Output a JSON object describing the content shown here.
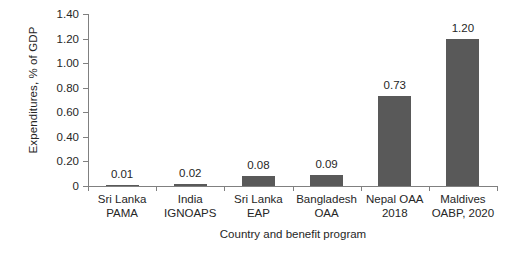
{
  "chart_data": {
    "type": "bar",
    "title": "",
    "subtitle": "",
    "xlabel": "Country and benefit program",
    "ylabel": "Expenditures, % of GDP",
    "categories": [
      "Sri Lanka PAMA",
      "India IGNOAPS",
      "Sri Lanka EAP",
      "Bangladesh OAA",
      "Nepal OAA 2018",
      "Maldives OABP, 2020"
    ],
    "category_lines": [
      [
        "Sri Lanka",
        "PAMA"
      ],
      [
        "India",
        "IGNOAPS"
      ],
      [
        "Sri Lanka",
        "EAP"
      ],
      [
        "Bangladesh",
        "OAA"
      ],
      [
        "Nepal OAA",
        "2018"
      ],
      [
        "Maldives",
        "OABP, 2020"
      ]
    ],
    "values": [
      0.01,
      0.02,
      0.08,
      0.09,
      0.73,
      1.2
    ],
    "data_labels": [
      "0.01",
      "0.02",
      "0.08",
      "0.09",
      "0.73",
      "1.20"
    ],
    "ylim": [
      0,
      1.4
    ],
    "ytick_values": [
      0,
      0.2,
      0.4,
      0.6,
      0.8,
      1.0,
      1.2,
      1.4
    ],
    "ytick_labels": [
      "0",
      "0.20",
      "0.40",
      "0.60",
      "0.80",
      "1.00",
      "1.20",
      "1.40"
    ],
    "grid": false,
    "legend": false,
    "legend_position": "none",
    "bar_color": "#595959",
    "axis_color": "#808080",
    "text_color": "#262626",
    "background_color": "#ffffff"
  }
}
